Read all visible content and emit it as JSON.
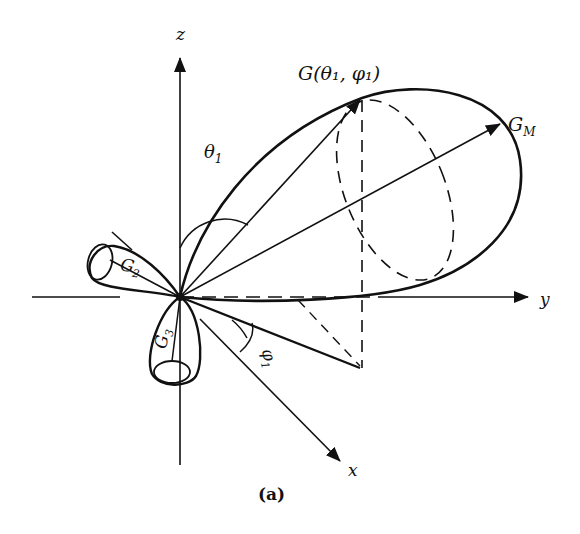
{
  "diagram": {
    "caption": "(a)",
    "axes": {
      "z": "z",
      "y": "y",
      "x": "x"
    },
    "labels": {
      "point": "G(θ₁, φ₁)",
      "max_gain": "G",
      "max_gain_sub": "M",
      "g2": "G",
      "g2_sub": "2",
      "g3": "G",
      "g3_sub": "3",
      "theta": "θ",
      "theta_sub": "1",
      "phi": "φ",
      "phi_sub": "1"
    },
    "colors": {
      "ink": "#111111",
      "background": "#ffffff"
    }
  }
}
